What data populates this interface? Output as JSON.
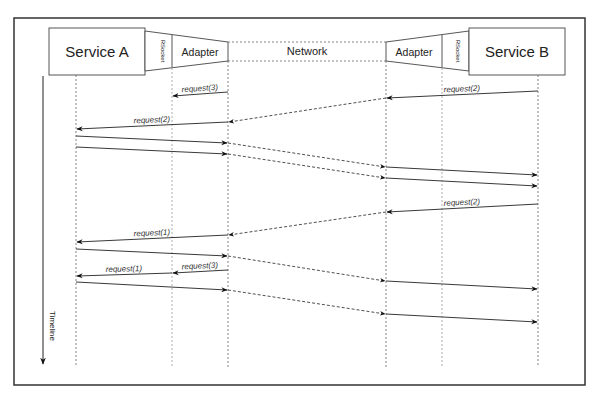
{
  "participants": {
    "service_a": "Service A",
    "rsocket_a": "RSocket",
    "adapter_a": "Adapter",
    "network": "Network",
    "adapter_b": "Adapter",
    "rsocket_b": "RSocket",
    "service_b": "Service B"
  },
  "timeline_label": "Timeline",
  "messages": [
    {
      "label": "request(3)",
      "from": "adapter_a",
      "to": "rsocket_a",
      "y1": 92,
      "y2": 96,
      "style": "solid"
    },
    {
      "label": "request(2)",
      "from": "service_b",
      "to": "adapter_b",
      "y1": 91,
      "y2": 98,
      "style": "solid"
    },
    {
      "label": "",
      "from": "adapter_b",
      "to": "adapter_a",
      "y1": 98,
      "y2": 122,
      "style": "dashed"
    },
    {
      "label": "request(2)",
      "from": "adapter_a",
      "to": "service_a",
      "y1": 122,
      "y2": 129,
      "style": "solid"
    },
    {
      "label": "",
      "from": "service_a",
      "to": "adapter_a",
      "y1": 136,
      "y2": 143,
      "style": "solid"
    },
    {
      "label": "",
      "from": "adapter_a",
      "to": "adapter_b",
      "y1": 143,
      "y2": 167,
      "style": "dashed"
    },
    {
      "label": "",
      "from": "adapter_b",
      "to": "service_b",
      "y1": 167,
      "y2": 175,
      "style": "solid"
    },
    {
      "label": "",
      "from": "service_a",
      "to": "adapter_a",
      "y1": 147,
      "y2": 154,
      "style": "solid"
    },
    {
      "label": "",
      "from": "adapter_a",
      "to": "adapter_b",
      "y1": 154,
      "y2": 178,
      "style": "dashed"
    },
    {
      "label": "",
      "from": "adapter_b",
      "to": "service_b",
      "y1": 178,
      "y2": 186,
      "style": "solid"
    },
    {
      "label": "request(2)",
      "from": "service_b",
      "to": "adapter_b",
      "y1": 204,
      "y2": 212,
      "style": "solid"
    },
    {
      "label": "",
      "from": "adapter_b",
      "to": "adapter_a",
      "y1": 212,
      "y2": 235,
      "style": "dashed"
    },
    {
      "label": "request(1)",
      "from": "adapter_a",
      "to": "service_a",
      "y1": 235,
      "y2": 242,
      "style": "solid"
    },
    {
      "label": "",
      "from": "service_a",
      "to": "adapter_a",
      "y1": 249,
      "y2": 256,
      "style": "solid"
    },
    {
      "label": "",
      "from": "adapter_a",
      "to": "adapter_b",
      "y1": 256,
      "y2": 281,
      "style": "dashed"
    },
    {
      "label": "",
      "from": "adapter_b",
      "to": "service_b",
      "y1": 281,
      "y2": 289,
      "style": "solid"
    },
    {
      "label": "request(3)",
      "from": "adapter_a",
      "to": "rsocket_a",
      "y1": 270,
      "y2": 273,
      "style": "solid"
    },
    {
      "label": "request(1)",
      "from": "rsocket_a",
      "to": "service_a",
      "y1": 273,
      "y2": 276,
      "style": "solid"
    },
    {
      "label": "",
      "from": "service_a",
      "to": "adapter_a",
      "y1": 282,
      "y2": 290,
      "style": "solid"
    },
    {
      "label": "",
      "from": "adapter_a",
      "to": "adapter_b",
      "y1": 290,
      "y2": 314,
      "style": "dashed"
    },
    {
      "label": "",
      "from": "adapter_b",
      "to": "service_b",
      "y1": 314,
      "y2": 322,
      "style": "solid"
    }
  ],
  "colors": {
    "frame": "#333333",
    "line": "#222222",
    "lifeline": "#555555",
    "background": "#ffffff"
  }
}
